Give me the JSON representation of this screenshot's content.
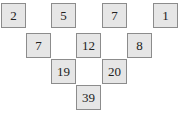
{
  "pyramid": {
    "rows": [
      {
        "cells": [
          {
            "value": "2",
            "x": 1,
            "y": 3
          },
          {
            "value": "",
            "x": 26,
            "y": 3,
            "empty": true
          },
          {
            "value": "5",
            "x": 51,
            "y": 3
          },
          {
            "value": "",
            "x": 76,
            "y": 3,
            "empty": true
          },
          {
            "value": "7",
            "x": 102,
            "y": 3
          },
          {
            "value": "",
            "x": 127,
            "y": 3,
            "empty": true
          },
          {
            "value": "1",
            "x": 153,
            "y": 3
          }
        ]
      },
      {
        "cells": [
          {
            "value": "7",
            "x": 26,
            "y": 33
          },
          {
            "value": "",
            "x": 51,
            "y": 33,
            "empty": true
          },
          {
            "value": "12",
            "x": 76,
            "y": 33
          },
          {
            "value": "",
            "x": 102,
            "y": 33,
            "empty": true
          },
          {
            "value": "8",
            "x": 127,
            "y": 33
          }
        ]
      },
      {
        "cells": [
          {
            "value": "19",
            "x": 51,
            "y": 59
          },
          {
            "value": "",
            "x": 76,
            "y": 59,
            "empty": true
          },
          {
            "value": "20",
            "x": 102,
            "y": 59
          }
        ]
      },
      {
        "cells": [
          {
            "value": "39",
            "x": 76,
            "y": 85
          }
        ]
      }
    ]
  }
}
